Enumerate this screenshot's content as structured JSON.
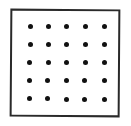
{
  "figure": {
    "rows": 5,
    "cols": 5,
    "colors": {
      "frame": "#2a2a2a",
      "dot": "#111111",
      "background": "#ffffff"
    },
    "dots": [
      {
        "x": 30,
        "y": 26
      },
      {
        "x": 48,
        "y": 26
      },
      {
        "x": 66,
        "y": 26
      },
      {
        "x": 85,
        "y": 26
      },
      {
        "x": 104,
        "y": 26
      },
      {
        "x": 30,
        "y": 44
      },
      {
        "x": 48,
        "y": 44
      },
      {
        "x": 66,
        "y": 44
      },
      {
        "x": 85,
        "y": 44
      },
      {
        "x": 104,
        "y": 44
      },
      {
        "x": 29,
        "y": 62
      },
      {
        "x": 48,
        "y": 62
      },
      {
        "x": 66,
        "y": 62
      },
      {
        "x": 85,
        "y": 62
      },
      {
        "x": 104,
        "y": 62
      },
      {
        "x": 29,
        "y": 80
      },
      {
        "x": 47,
        "y": 80
      },
      {
        "x": 66,
        "y": 80
      },
      {
        "x": 84,
        "y": 80
      },
      {
        "x": 104,
        "y": 80
      },
      {
        "x": 29,
        "y": 98
      },
      {
        "x": 47,
        "y": 98
      },
      {
        "x": 66,
        "y": 99
      },
      {
        "x": 84,
        "y": 99
      },
      {
        "x": 104,
        "y": 99
      }
    ]
  }
}
